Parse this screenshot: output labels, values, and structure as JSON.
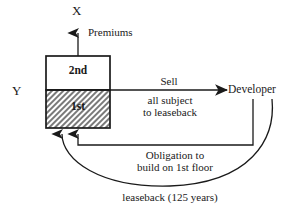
{
  "diagram": {
    "type": "flow-diagram",
    "nodes": {
      "x_label": "X",
      "y_label": "Y",
      "building": {
        "upper_floor": "2nd",
        "lower_floor": "1st",
        "lower_floor_fill": "hatched"
      },
      "developer": "Developer"
    },
    "edges": {
      "premiums": "Premiums",
      "sell": "Sell",
      "sell_detail": "all subject\nto leaseback",
      "sell_detail_line1": "all subject",
      "sell_detail_line2": "to leaseback",
      "obligation_line1": "Obligation to",
      "obligation_line2": "build on 1st floor",
      "leaseback": "leaseback (125 years)"
    },
    "colors": {
      "stroke": "#1a1a1a",
      "background": "#ffffff",
      "hatch": "#6b6b6b"
    }
  }
}
